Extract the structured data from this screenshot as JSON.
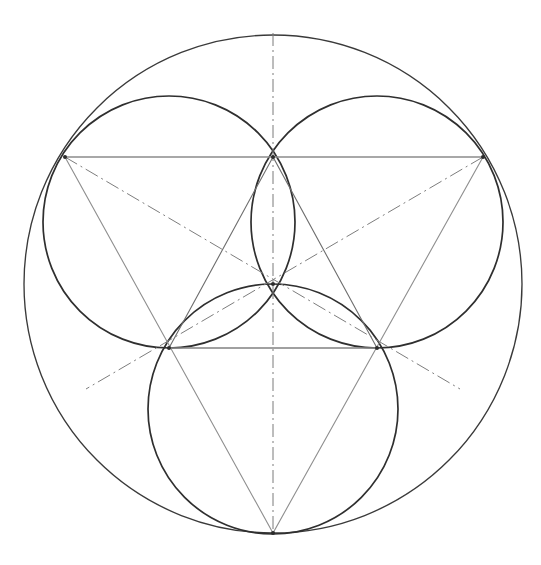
{
  "document": {
    "title": "Geometric Construction — Triquetra in Circle",
    "background_color": "#ffffff",
    "width": 541,
    "height": 565,
    "medium": "pencil line drawing",
    "caption": ""
  },
  "palette": {
    "outer_circle": "#3a3a3a",
    "inner_circle": "#2f2f2f",
    "triangle": "#8f8f8f",
    "inner_triangle": "#6e6e6e",
    "chord": "#8a8a8a",
    "construction_axis": "#7a7a7a",
    "node": "#2b2b2b",
    "paper": "#ffffff"
  },
  "geometry": {
    "center": {
      "x": 273,
      "y": 284,
      "label": "centroid"
    },
    "circles": [
      {
        "name": "outer-circumscribed-circle",
        "cx": 273,
        "cy": 284,
        "r": 249,
        "stroke": "#3a3a3a",
        "stroke_width": 1.35,
        "role": "circumcircle"
      },
      {
        "name": "upper-left-circle",
        "cx": 169,
        "cy": 222,
        "r": 126,
        "stroke": "#2f2f2f",
        "stroke_width": 1.7,
        "role": "petal"
      },
      {
        "name": "upper-right-circle",
        "cx": 377,
        "cy": 222,
        "r": 126,
        "stroke": "#2f2f2f",
        "stroke_width": 1.7,
        "role": "petal"
      },
      {
        "name": "bottom-circle",
        "cx": 273,
        "cy": 409,
        "r": 125,
        "stroke": "#2f2f2f",
        "stroke_width": 1.7,
        "role": "petal"
      }
    ],
    "triangles": [
      {
        "name": "outer-triangle",
        "points": "65,157 483,157 273,533",
        "stroke": "#8f8f8f",
        "stroke_width": 1.1,
        "role": "inscribed equilateral triangle"
      },
      {
        "name": "inner-triangle",
        "points": "273,157 169,348 377,348",
        "stroke": "#6e6e6e",
        "stroke_width": 1.1,
        "role": "medial equilateral triangle"
      }
    ],
    "chords": [
      {
        "name": "upper-horizontal-chord",
        "x1": 65,
        "y1": 157,
        "x2": 483,
        "y2": 157,
        "stroke": "#8a8a8a"
      },
      {
        "name": "lower-horizontal-chord",
        "x1": 169,
        "y1": 348,
        "x2": 377,
        "y2": 348,
        "stroke": "#8a8a8a"
      }
    ],
    "axes": [
      {
        "name": "vertical-axis",
        "x1": 273,
        "y1": 33,
        "x2": 273,
        "y2": 535,
        "style": "dash-dot",
        "stroke": "#7a7a7a"
      }
    ],
    "radials": [
      {
        "name": "radial-upper-left",
        "x1": 65,
        "y1": 157,
        "x2": 460,
        "y2": 389,
        "angle_deg": 30,
        "style": "dash-dot"
      },
      {
        "name": "radial-upper-right",
        "x1": 483,
        "y1": 157,
        "x2": 86,
        "y2": 389,
        "angle_deg": 150,
        "style": "dash-dot"
      }
    ],
    "nodes": [
      {
        "name": "vertex-top-left",
        "x": 65,
        "y": 157
      },
      {
        "name": "vertex-top-right",
        "x": 483,
        "y": 157
      },
      {
        "name": "vertex-bottom",
        "x": 273,
        "y": 533
      },
      {
        "name": "node-top-center",
        "x": 273,
        "y": 157
      },
      {
        "name": "node-center",
        "x": 273,
        "y": 284
      },
      {
        "name": "node-mid-left",
        "x": 169,
        "y": 348
      },
      {
        "name": "node-mid-right",
        "x": 377,
        "y": 348
      }
    ]
  },
  "annotations": {
    "figure_label": "",
    "notes": []
  }
}
